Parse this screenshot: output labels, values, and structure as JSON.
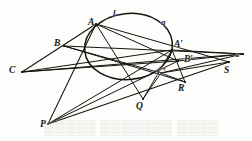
{
  "figure": {
    "kind": "projective-geometry-diagram",
    "ink_color": "#15130e",
    "paper_color": "#fdfdfb",
    "ghost_color": "#d9d6d0",
    "width": 252,
    "height": 141
  },
  "conic": {
    "name": "circle",
    "cx": 128.5,
    "cy": 46.5,
    "rx": 44.0,
    "ry": 33.0,
    "rotation": -6
  },
  "labels": [
    {
      "id": "A",
      "text": "A",
      "x": 88,
      "y": 18,
      "size": 9.5
    },
    {
      "id": "l",
      "text": "l",
      "x": 113,
      "y": 9,
      "size": 9.0
    },
    {
      "id": "a",
      "text": "a",
      "x": 161,
      "y": 18,
      "size": 9.0
    },
    {
      "id": "B",
      "text": "B",
      "x": 54,
      "y": 39,
      "size": 9.5
    },
    {
      "id": "Aprime",
      "text": "A′",
      "x": 174,
      "y": 40,
      "size": 9.5
    },
    {
      "id": "Bprime",
      "text": "B′",
      "x": 184,
      "y": 55,
      "size": 9.5
    },
    {
      "id": "C",
      "text": "C",
      "x": 9,
      "y": 66,
      "size": 9.5
    },
    {
      "id": "Cprime",
      "text": "C′",
      "x": 157,
      "y": 68,
      "size": 9.5
    },
    {
      "id": "z",
      "text": "z",
      "x": 236,
      "y": 50,
      "size": 9.0
    },
    {
      "id": "S",
      "text": "S",
      "x": 224,
      "y": 66,
      "size": 9.5
    },
    {
      "id": "R",
      "text": "R",
      "x": 178,
      "y": 84,
      "size": 9.5
    },
    {
      "id": "Q",
      "text": "Q",
      "x": 136,
      "y": 102,
      "size": 9.5
    },
    {
      "id": "P",
      "text": "P",
      "x": 40,
      "y": 120,
      "size": 9.5
    }
  ],
  "points": {
    "A": {
      "x": 96,
      "y": 24
    },
    "B": {
      "x": 64,
      "y": 46
    },
    "C": {
      "x": 22,
      "y": 72
    },
    "Aprime": {
      "x": 172,
      "y": 50
    },
    "Bprime": {
      "x": 178,
      "y": 61
    },
    "Cprime": {
      "x": 161,
      "y": 73
    },
    "P": {
      "x": 48,
      "y": 124
    },
    "Q": {
      "x": 143,
      "y": 99
    },
    "R": {
      "x": 185,
      "y": 82
    },
    "S": {
      "x": 229,
      "y": 62
    },
    "z": {
      "x": 243,
      "y": 54
    },
    "l_on_circle": {
      "x": 116,
      "y": 14
    },
    "a_on_circle": {
      "x": 166,
      "y": 26
    }
  },
  "lines": [
    {
      "id": "C-z",
      "from": "C",
      "to": "z",
      "width": 1.15
    },
    {
      "id": "C-Aprime",
      "from": "C",
      "to": "Aprime",
      "width": 1.0
    },
    {
      "id": "C-Bprime",
      "from": "C",
      "to": "Bprime",
      "width": 1.0
    },
    {
      "id": "C-A",
      "from": "C",
      "to": "A",
      "width": 1.1
    },
    {
      "id": "B-z",
      "from": "B",
      "to": "z",
      "width": 1.0
    },
    {
      "id": "B-Cprime",
      "from": "B",
      "to": "Cprime",
      "width": 1.0
    },
    {
      "id": "B-R",
      "from": "B",
      "to": "R",
      "width": 1.0
    },
    {
      "id": "A-S",
      "from": "A",
      "to": "S",
      "width": 1.0
    },
    {
      "id": "A-Bprime",
      "from": "A",
      "to": "Bprime",
      "width": 1.0
    },
    {
      "id": "A-Q",
      "from": "A",
      "to": "Q",
      "width": 1.0
    },
    {
      "id": "P-A",
      "from": "P",
      "to": "A",
      "width": 1.05
    },
    {
      "id": "P-Aprime",
      "from": "P",
      "to": "Aprime",
      "width": 1.0
    },
    {
      "id": "P-Bprime",
      "from": "P",
      "to": "Bprime",
      "width": 1.0
    },
    {
      "id": "P-S",
      "from": "P",
      "to": "S",
      "width": 1.05
    },
    {
      "id": "Q-Aprime",
      "from": "Q",
      "to": "Aprime",
      "width": 1.0
    },
    {
      "id": "Q-Cprime",
      "from": "Q",
      "to": "Cprime",
      "width": 1.0
    },
    {
      "id": "Cprime-R",
      "from": "Cprime",
      "to": "R",
      "width": 1.0
    },
    {
      "id": "Aprime-R",
      "from": "Aprime",
      "to": "R",
      "width": 1.0
    },
    {
      "id": "Aprime-z",
      "from": "Aprime",
      "to": "z",
      "width": 1.0
    },
    {
      "id": "Bprime-z",
      "from": "Bprime",
      "to": "z",
      "width": 1.0
    },
    {
      "id": "Cprime-z",
      "from": "Cprime",
      "to": "z",
      "width": 1.0
    },
    {
      "id": "Cprime-S",
      "from": "Cprime",
      "to": "S",
      "width": 1.0
    }
  ],
  "bleed_through": {
    "visible": true,
    "text": "▒▒▒▒▒ ▒▒▒▒▒▒▒ ▒▒▒▒ ▒▒▒"
  }
}
